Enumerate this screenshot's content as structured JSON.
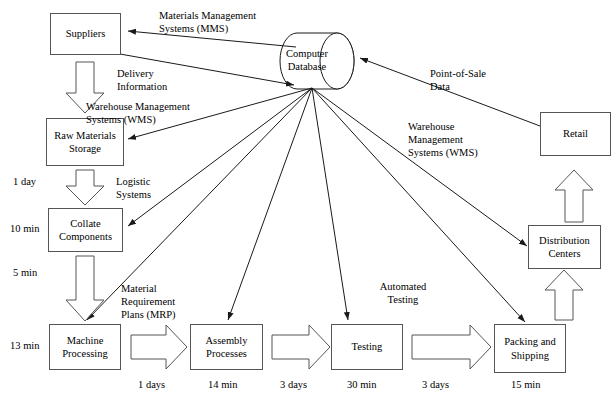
{
  "diagram": {
    "colors": {
      "stroke": "#555555",
      "line": "#1a1a1a",
      "background": "#ffffff"
    },
    "nodes": {
      "suppliers": {
        "label": "Suppliers"
      },
      "raw_materials": {
        "label": "Raw Materials\nStorage"
      },
      "collate": {
        "label": "Collate\nComponents"
      },
      "machine": {
        "label": "Machine\nProcessing"
      },
      "assembly": {
        "label": "Assembly\nProcesses"
      },
      "testing": {
        "label": "Testing"
      },
      "packing": {
        "label": "Packing\nand\nShipping"
      },
      "distribution": {
        "label": "Distribution\nCenters"
      },
      "retail": {
        "label": "Retail"
      },
      "database": {
        "label": "Computer\nDatabase"
      }
    },
    "edge_labels": {
      "mms": "Materials Management\nSystems (MMS)",
      "delivery": "Delivery\nInformation",
      "wms_left": "Warehouse Management\nSystems (WMS)",
      "logistic": "Logistic\nSystems",
      "mrp": "Material\nRequirement\nPlans (MRP)",
      "automated_testing": "Automated\nTesting",
      "pos": "Point-of-Sale\nData",
      "wms_right": "Warehouse\nManagement\nSystems (WMS)"
    },
    "time_labels": {
      "raw_to_collate": "1 day",
      "collate": "10 min",
      "collate_to_machine": "5 min",
      "machine": "13 min",
      "machine_to_assembly": "1 days",
      "assembly": "14 min",
      "assembly_to_testing": "3 days",
      "testing": "30 min",
      "testing_to_packing": "3 days",
      "packing": "15 min"
    }
  }
}
